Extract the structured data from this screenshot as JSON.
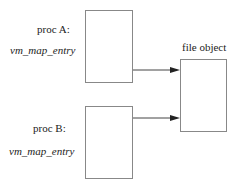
{
  "proc_a": {
    "label": "proc A:",
    "sublabel": "vm_map_entry"
  },
  "proc_b": {
    "label": "proc B:",
    "sublabel": "vm_map_entry"
  },
  "file_object": {
    "label": "file object"
  },
  "colors": {
    "line": "#888888",
    "arrow": "#222222"
  }
}
